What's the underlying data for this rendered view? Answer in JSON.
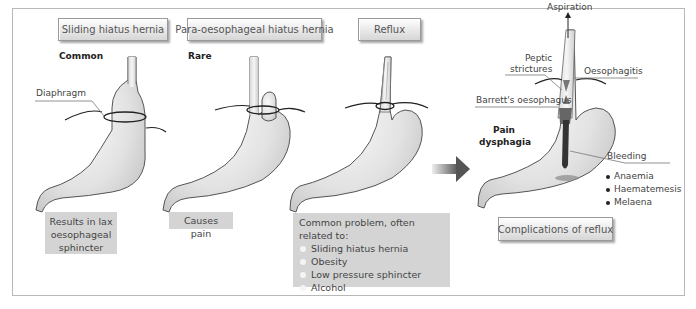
{
  "panels": [
    {
      "title": "Sliding hiatus hernia",
      "frequency": "Common",
      "note": [
        "Results in lax",
        "oesophageal",
        "sphincter"
      ]
    },
    {
      "title": "Para-oesophageal hiatus hernia",
      "frequency": "Rare",
      "note": [
        "Causes pain"
      ]
    },
    {
      "title": "Reflux",
      "factors_heading": "Common problem, often related to:",
      "factors": [
        "Sliding hiatus hernia",
        "Obesity",
        "Low pressure sphincter",
        "Alcohol"
      ]
    }
  ],
  "labels": {
    "diaphragm": "Diaphragm",
    "aspiration": "Aspiration",
    "peptic_strictures": [
      "Peptic",
      "strictures"
    ],
    "oesophagitis": "Oesophagitis",
    "barretts": "Barrett's oesophagus",
    "pain_dysphagia": [
      "Pain",
      "dysphagia"
    ],
    "bleeding": "Bleeding",
    "bleeding_effects": [
      "Anaemia",
      "Haematemesis",
      "Melaena"
    ]
  },
  "complications_title": "Complications of reflux",
  "icons": {
    "arrow": "arrow-right-icon",
    "aspiration_arrow": "arrow-up-icon"
  },
  "colors": {
    "stomach_fill": "#e6e6e6",
    "stomach_shade": "#bdbdbd",
    "outline": "#555555",
    "label_box": "#d4d4d4",
    "frame": "#b8b8b8"
  }
}
